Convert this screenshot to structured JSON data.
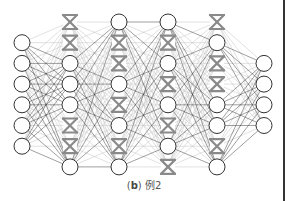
{
  "figure": {
    "caption_prefix_open": "(",
    "caption_label": "b",
    "caption_prefix_close": ")",
    "caption_text": "例2"
  },
  "network": {
    "description": "Fully connected network with dropout; crossed nodes are dropped units",
    "layers": [
      {
        "name": "input",
        "nodes": [
          "on",
          "on",
          "on",
          "on",
          "on",
          "on"
        ],
        "slots": [
          1,
          2,
          3,
          4,
          5,
          6
        ]
      },
      {
        "name": "hidden-1",
        "nodes": [
          "off",
          "off",
          "on",
          "on",
          "on",
          "off",
          "off",
          "on"
        ],
        "slots": [
          0,
          1,
          2,
          3,
          4,
          5,
          6,
          7
        ]
      },
      {
        "name": "hidden-2",
        "nodes": [
          "on",
          "off",
          "off",
          "on",
          "off",
          "on",
          "off",
          "on"
        ],
        "slots": [
          0,
          1,
          2,
          3,
          4,
          5,
          6,
          7
        ]
      },
      {
        "name": "hidden-3",
        "nodes": [
          "on",
          "off",
          "on",
          "off",
          "on",
          "off",
          "on",
          "off"
        ],
        "slots": [
          0,
          1,
          2,
          3,
          4,
          5,
          6,
          7
        ]
      },
      {
        "name": "hidden-4",
        "nodes": [
          "off",
          "on",
          "off",
          "off",
          "on",
          "on",
          "off",
          "on"
        ],
        "slots": [
          0,
          1,
          2,
          3,
          4,
          5,
          6,
          7
        ]
      },
      {
        "name": "output",
        "nodes": [
          "on",
          "on",
          "on",
          "on"
        ],
        "slots": [
          2,
          3,
          4,
          5
        ]
      }
    ],
    "colors": {
      "active_edge": "#2a2a2a",
      "dropped_edge": "#c8c8c8",
      "node_stroke": "#333333",
      "dropped_mark": "#8a8a8a"
    }
  }
}
